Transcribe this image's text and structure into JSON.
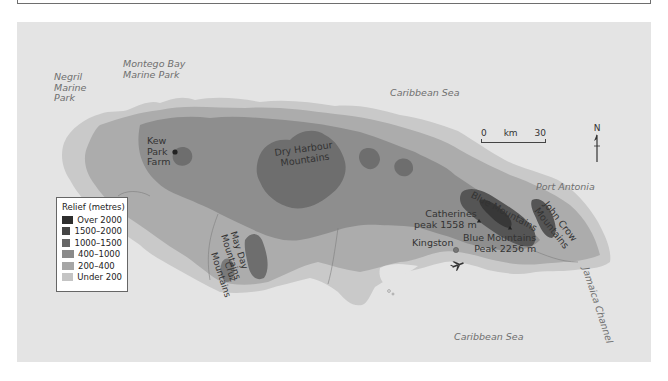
{
  "map": {
    "title": "Relief map of Jamaica",
    "legend": {
      "title": "Relief (metres)",
      "items": [
        {
          "label": "Over 2000",
          "color": "#2e2e2e"
        },
        {
          "label": "1500–2000",
          "color": "#454545"
        },
        {
          "label": "1000–1500",
          "color": "#666666"
        },
        {
          "label": "400–1000",
          "color": "#8a8a8a"
        },
        {
          "label": "200–400",
          "color": "#a6a6a6"
        },
        {
          "label": "Under 200",
          "color": "#c4c4c4"
        }
      ]
    },
    "scale": {
      "start": "0",
      "unit": "km",
      "end": "30"
    },
    "north": "N",
    "seas": {
      "north": "Caribbean Sea",
      "south": "Caribbean Sea",
      "channel": "Jamaica Channel"
    },
    "marine_parks": {
      "negril": [
        "Negril",
        "Marine",
        "Park"
      ],
      "montego": [
        "Montego Bay",
        "Marine Park"
      ]
    },
    "places": {
      "kew": [
        "Kew",
        "Park",
        "Farm"
      ],
      "port_antonia": "Port Antonia",
      "kingston": "Kingston"
    },
    "mountains": {
      "dry_harbour": [
        "Dry Harbour",
        "Mountains"
      ],
      "may_day": [
        "May Day",
        "Mountains"
      ],
      "cruz": [
        "Cruz",
        "Mountains"
      ],
      "blue": "Blue Mountains",
      "john_crow": [
        "John Crow",
        "Mountains"
      ]
    },
    "peaks": {
      "catherines": [
        "Catherines",
        "peak 1558 m"
      ],
      "blue_mountain_peak": [
        "Blue Mountains",
        "Peak 2256 m"
      ]
    },
    "icons": {
      "airport": "airplane-icon",
      "north": "north-arrow-icon"
    }
  }
}
